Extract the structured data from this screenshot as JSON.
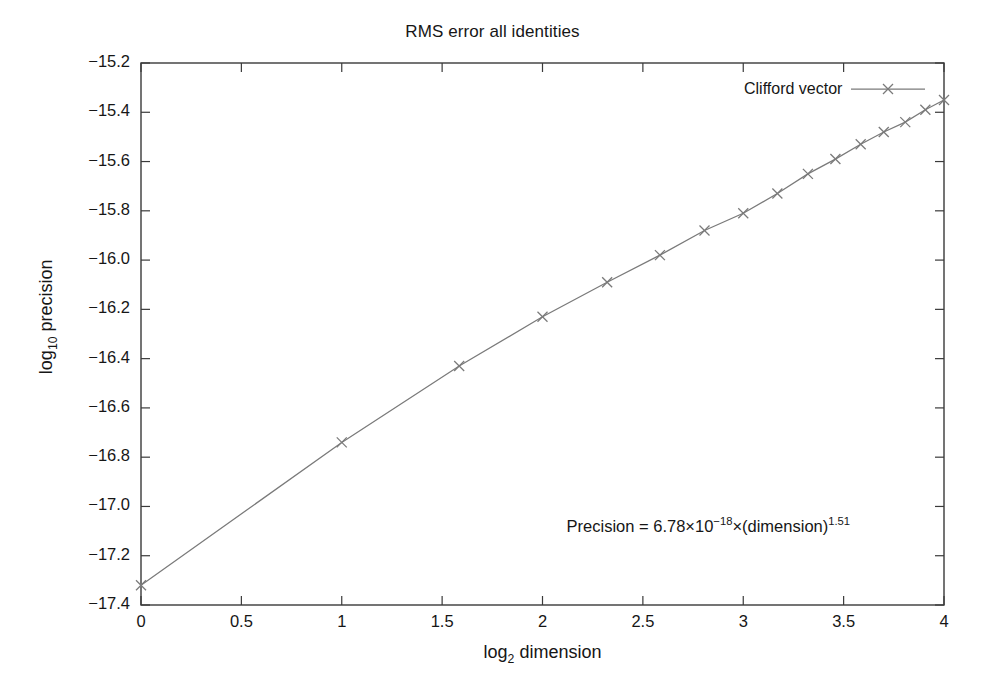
{
  "chart_data": {
    "type": "line",
    "title": "RMS error all identities",
    "xlabel": "log2 dimension",
    "xlabel_base": "log",
    "xlabel_sub": "2",
    "xlabel_rest": " dimension",
    "ylabel_base": "log",
    "ylabel_sub": "10",
    "ylabel_rest": " precision",
    "ylabel": "log10 precision",
    "xlim": [
      0,
      4
    ],
    "ylim": [
      -17.4,
      -15.2
    ],
    "grid": false,
    "legend_position": "top-right inside",
    "xticks": [
      0,
      0.5,
      1,
      1.5,
      2,
      2.5,
      3,
      3.5,
      4
    ],
    "xtick_labels": [
      "0",
      "0.5",
      "1",
      "1.5",
      "2",
      "2.5",
      "3",
      "3.5",
      "4"
    ],
    "yticks": [
      -15.2,
      -15.4,
      -15.6,
      -15.8,
      -16.0,
      -16.2,
      -16.4,
      -16.6,
      -16.8,
      -17.0,
      -17.2,
      -17.4
    ],
    "ytick_labels": [
      "−15.2",
      "−15.4",
      "−15.6",
      "−15.8",
      "−16.0",
      "−16.2",
      "−16.4",
      "−16.6",
      "−16.8",
      "−17.0",
      "−17.2",
      "−17.4"
    ],
    "series": [
      {
        "name": "Clifford vector",
        "marker": "x",
        "color": "#7a7a7a",
        "x": [
          0,
          1,
          1.585,
          2,
          2.322,
          2.585,
          2.807,
          3,
          3.17,
          3.322,
          3.459,
          3.585,
          3.7,
          3.807,
          3.907,
          4
        ],
        "y": [
          -17.32,
          -16.74,
          -16.43,
          -16.23,
          -16.09,
          -15.98,
          -15.88,
          -15.81,
          -15.73,
          -15.65,
          -15.59,
          -15.53,
          -15.48,
          -15.44,
          -15.39,
          -15.35
        ]
      }
    ],
    "annotations": [
      {
        "name": "fit-equation",
        "text": "Precision = 6.78×10⁻¹⁸×(dimension)¹·⁵¹",
        "parts": {
          "lead": "Precision = 6.78",
          "times1": "×",
          "ten": "10",
          "exp1": "−18",
          "times2": "×",
          "base": "(dimension)",
          "exp2": "1.51"
        },
        "x": 2.12,
        "y": -17.08
      }
    ]
  },
  "legend": {
    "label": "Clifford vector"
  }
}
